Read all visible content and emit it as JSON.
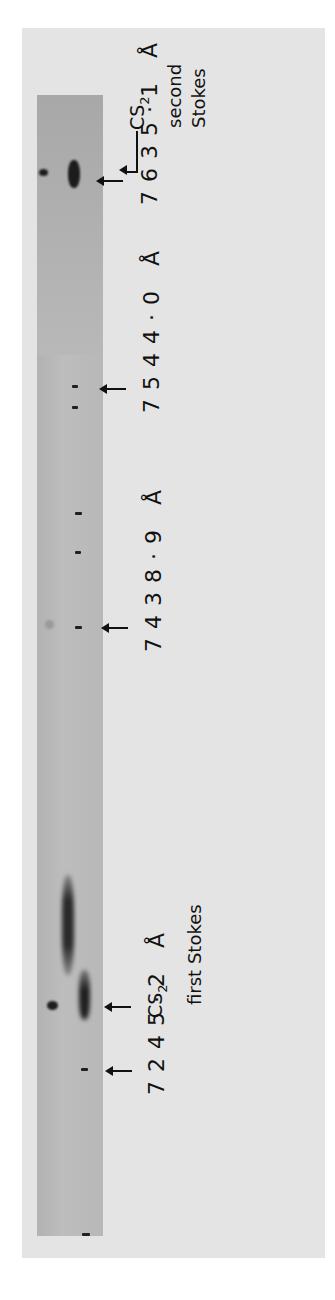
{
  "figure": {
    "annotations": [
      {
        "id": "cs2-second-stokes",
        "species": "CS",
        "subscript": "2",
        "line1": "second",
        "line2": "Stokes"
      },
      {
        "id": "cs2-first-stokes",
        "species": "CS",
        "subscript": "2",
        "line1": "first Stokes"
      }
    ],
    "wavelength_markers": [
      {
        "id": "wl-7635",
        "label": "7635·1 Å",
        "value_angstrom": 7635.1
      },
      {
        "id": "wl-7544",
        "label": "7544·0 Å",
        "value_angstrom": 7544.0
      },
      {
        "id": "wl-7438",
        "label": "7438·9 Å",
        "value_angstrom": 7438.9
      },
      {
        "id": "wl-7245",
        "label": "7245·2 Å",
        "value_angstrom": 7245.2
      }
    ],
    "colors": {
      "background": "#ffffff",
      "card": "#e4e4e4",
      "strip": "#b8b8b8",
      "ink": "#111111"
    }
  }
}
